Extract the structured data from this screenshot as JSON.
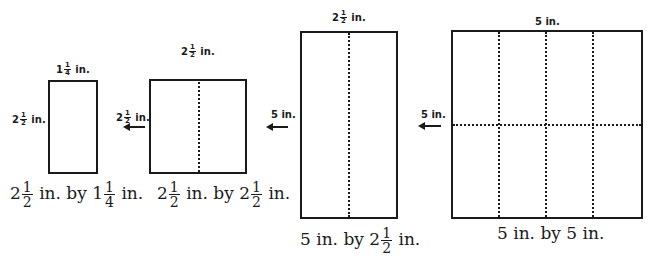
{
  "figure": {
    "panels": [
      {
        "id": "panel-1",
        "top_label": {
          "whole": "1",
          "num": "1",
          "den": "4",
          "unit": "in."
        },
        "side_label": {
          "whole": "2",
          "num": "1",
          "den": "2",
          "unit": "in."
        },
        "caption": {
          "a_whole": "2",
          "a_num": "1",
          "a_den": "2",
          "a_unit": "in.",
          "by": "by",
          "b_whole": "1",
          "b_num": "1",
          "b_den": "4",
          "b_unit": "in."
        }
      },
      {
        "id": "panel-2",
        "top_label": {
          "whole": "2",
          "num": "1",
          "den": "2",
          "unit": "in."
        },
        "side_label": {
          "whole": "2",
          "num": "1",
          "den": "2",
          "unit": "in."
        },
        "caption": {
          "a_whole": "2",
          "a_num": "1",
          "a_den": "2",
          "a_unit": "in.",
          "by": "by",
          "b_whole": "2",
          "b_num": "1",
          "b_den": "2",
          "b_unit": "in."
        }
      },
      {
        "id": "panel-3",
        "top_label": {
          "whole": "2",
          "num": "1",
          "den": "2",
          "unit": "in."
        },
        "side_label": {
          "text": "5 in."
        },
        "caption": {
          "a_text": "5 in.",
          "by": "by",
          "b_whole": "2",
          "b_num": "1",
          "b_den": "2",
          "b_unit": "in."
        }
      },
      {
        "id": "panel-4",
        "top_label": {
          "text": "5 in."
        },
        "side_label": {
          "text": "5 in."
        },
        "caption": {
          "text": "5 in. by 5 in."
        }
      }
    ]
  }
}
